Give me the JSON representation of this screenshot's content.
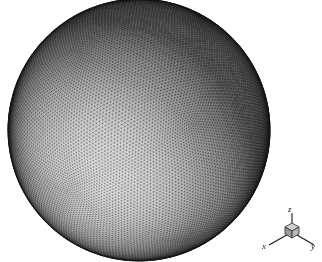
{
  "figure": {
    "background_color": "#ffffff",
    "width": 322,
    "height": 262,
    "caption": ""
  },
  "chart_data": {
    "type": "scatter",
    "title": "",
    "subtitle": "",
    "xlabel": "x",
    "ylabel": "y",
    "zlabel": "z",
    "render_style": "triangular surface mesh, wireframe over gray shaded surface",
    "object": {
      "shape": "sphere",
      "center_px": [
        139,
        130
      ],
      "radius_px": 131,
      "mesh": {
        "element_type": "triangle",
        "approx_edge_length_px": 5.2,
        "subdivision_frequency": 46,
        "shading": "diffuse gray, light source upper-left"
      }
    },
    "shading": {
      "light_direction": [
        -0.45,
        -0.55,
        0.7
      ],
      "highlight_center_px": [
        95,
        98
      ],
      "highlight_gray": "#f2f2f2",
      "mid_gray": "#b4b4b4",
      "rim_gray": "#5a5a5a",
      "edge_line_color": "#2b2b2b"
    },
    "grid": false,
    "legend": null,
    "axis_ranges": null
  },
  "axis_triad": {
    "name": "coordinate-axes-indicator",
    "origin_px": [
      292,
      232
    ],
    "cube": {
      "present": true,
      "size_px": 11,
      "top_face_color": "#c9c9c9",
      "left_face_color": "#9a9a9a",
      "right_face_color": "#b5b5b5",
      "outline_color": "#2b2b2b"
    },
    "axes": [
      {
        "label": "x",
        "direction": "lower-left",
        "length_px": 28,
        "color": "#1a1a1a"
      },
      {
        "label": "y",
        "direction": "lower-right",
        "length_px": 28,
        "color": "#1a1a1a"
      },
      {
        "label": "z",
        "direction": "up",
        "length_px": 26,
        "color": "#1a1a1a"
      }
    ],
    "labels": {
      "x": "x",
      "y": "y",
      "z": "z"
    }
  }
}
